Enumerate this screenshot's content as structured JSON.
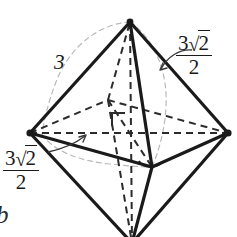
{
  "figure": {
    "name": "octahedron-geometry-figure",
    "shape": "octahedron",
    "background_color": "#ffffff",
    "line_color": "#1a1a1a",
    "hidden_line_color": "#2b2b2b",
    "guide_line_color": "#b9b9b9",
    "vertices": {
      "top_apex": [
        130,
        22
      ],
      "left": [
        30,
        133
      ],
      "right": [
        228,
        133
      ],
      "front": [
        152,
        167
      ],
      "back_hidden": [
        108,
        100
      ],
      "bottom_apex": [
        132,
        243
      ]
    },
    "markers": {
      "right_angle_square": {
        "x": 112,
        "y": 113,
        "size": 13
      },
      "front_vertex_arc": {
        "cx": 150,
        "cy": 163,
        "rx": 13,
        "ry": 6
      }
    }
  },
  "labels": {
    "edge_length": {
      "text": "3",
      "role": "arc-length-label"
    },
    "top_right_measure": {
      "numerator_coefficient": "3",
      "radical_symbol": "√",
      "radicand": "2",
      "denominator": "2",
      "role": "circumradius-label"
    },
    "bottom_left_measure": {
      "numerator_coefficient": "3",
      "radical_symbol": "√",
      "radicand": "2",
      "denominator": "2",
      "role": "half-diagonal-label"
    },
    "corner_glyph": {
      "text": "b",
      "role": "clipped-subfigure-letter"
    }
  }
}
